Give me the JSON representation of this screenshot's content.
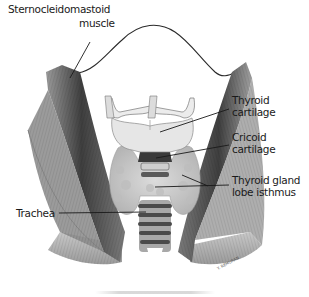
{
  "figure": {
    "labels": {
      "sternocleidomastoid": [
        "Sternocleidomastoid",
        "muscle"
      ],
      "thyroid_cartilage": [
        "Thyroid",
        "cartilage"
      ],
      "cricoid_cartilage": [
        "Cricoid",
        "cartilage"
      ],
      "thyroid_gland": [
        "Thyroid gland",
        "lobe isthmus"
      ],
      "trachea": "Trachea"
    },
    "signature": "Y. REMURAN",
    "colors": {
      "ink": "#1a1a1a",
      "muscle_dark": "#4a4a4a",
      "muscle_mid": "#8c8c8c",
      "cartilage": "#e4e4e4",
      "gland": "#cfcfcf",
      "background": "#ffffff"
    }
  }
}
